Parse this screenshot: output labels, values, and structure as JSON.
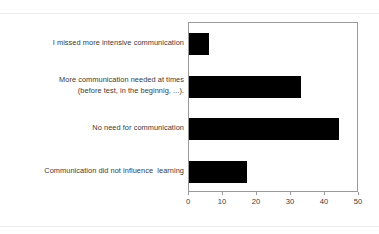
{
  "chart_data": {
    "type": "bar",
    "orientation": "horizontal",
    "title": "",
    "subtitle": "",
    "xlabel": "",
    "ylabel": "",
    "categories": [
      "I missed more intensive communication",
      "More communication needed at times (before test, in the beginnig, ...).",
      "No need for communication",
      "Communication did not influence  learning"
    ],
    "category_lines": [
      [
        "I missed more intensive communication"
      ],
      [
        "More communication needed at times",
        "(before test, in the beginnig, ...)."
      ],
      [
        "No need for communication"
      ],
      [
        "Communication did not influence  learning"
      ]
    ],
    "values": [
      6,
      33,
      44,
      17
    ],
    "xlim": [
      0,
      50
    ],
    "xticks": [
      0,
      10,
      20,
      30,
      40,
      50
    ],
    "xtick_labels": [
      "0",
      "10",
      "20",
      "30",
      "40",
      "50"
    ],
    "grid": false,
    "legend": false,
    "legend_position": "none",
    "bar_color": "#000000",
    "frame_color": "#9a9a9a",
    "text_color": "#3a3a3a",
    "background": "#ffffff"
  }
}
